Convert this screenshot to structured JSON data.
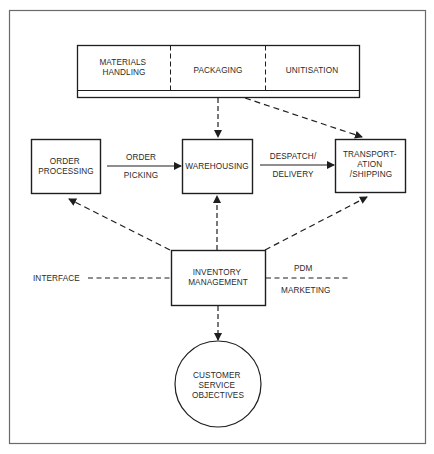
{
  "colors": {
    "frame": "#6a6a6a",
    "stroke": "#1e1e1e",
    "text": "#2a2a2a",
    "background": "#ffffff"
  },
  "top_bar": {
    "segments": [
      {
        "lines": [
          "MATERIALS",
          "HANDLING"
        ]
      },
      {
        "lines": [
          "PACKAGING"
        ]
      },
      {
        "lines": [
          "UNITISATION"
        ]
      }
    ]
  },
  "nodes": {
    "order_processing": {
      "lines": [
        "ORDER",
        "PROCESSING"
      ]
    },
    "warehousing": {
      "lines": [
        "WAREHOUSING"
      ]
    },
    "transportation": {
      "lines": [
        "TRANSPORT-",
        "ATION",
        "/SHIPPING"
      ]
    },
    "inventory_management": {
      "lines": [
        "INVENTORY",
        "MANAGEMENT"
      ]
    },
    "customer_service": {
      "lines": [
        "CUSTOMER",
        "SERVICE",
        "OBJECTIVES"
      ]
    }
  },
  "edges": {
    "order_picking": {
      "above": "ORDER",
      "below": "PICKING"
    },
    "despatch_delivery": {
      "above": "DESPATCH/",
      "below": "DELIVERY"
    }
  },
  "side_labels": {
    "interface": "INTERFACE",
    "pdm": "PDM",
    "marketing": "MARKETING"
  }
}
